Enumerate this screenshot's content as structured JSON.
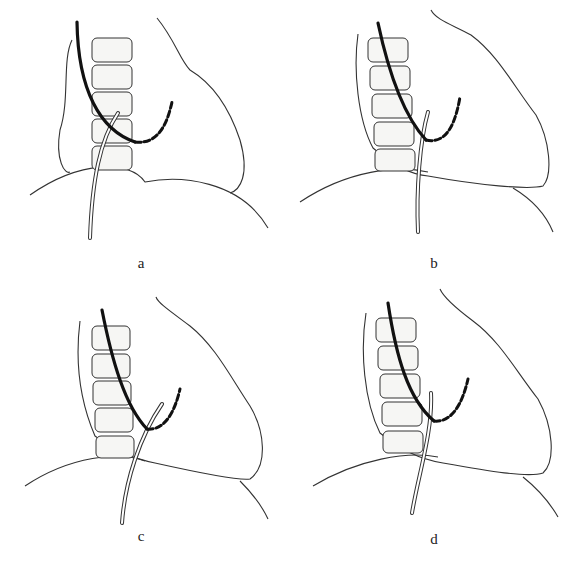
{
  "figure": {
    "panels": [
      {
        "id": "a",
        "label": "a"
      },
      {
        "id": "b",
        "label": "b"
      },
      {
        "id": "c",
        "label": "c"
      },
      {
        "id": "d",
        "label": "d"
      }
    ],
    "elements": {
      "vertebrae_count": 5,
      "catheter": "dark curved catheter with dashed tip",
      "needle": "double-line needle",
      "organ": "kidney outline",
      "body_contour": "lower curved contour"
    }
  }
}
